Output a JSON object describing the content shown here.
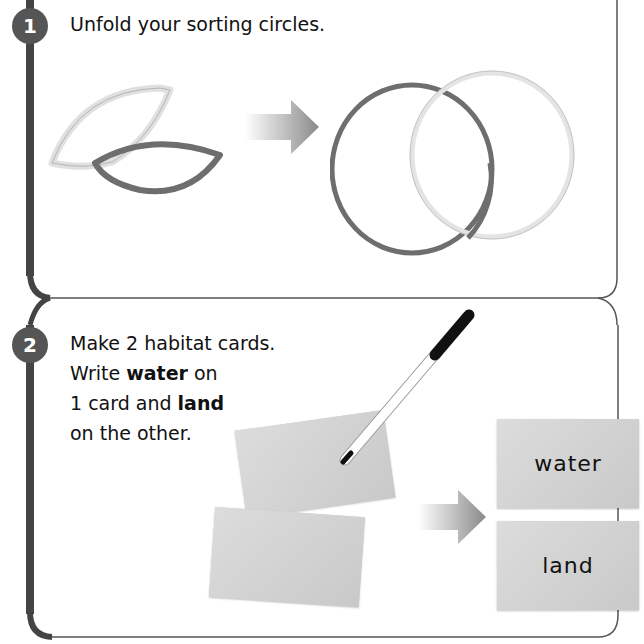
{
  "steps": [
    {
      "number": "1",
      "text": "Unfold your sorting circles."
    },
    {
      "number": "2",
      "lines": [
        {
          "pre": "Make 2 habitat cards.",
          "bold": "",
          "post": ""
        },
        {
          "pre": "Write ",
          "bold": "water",
          "post": " on"
        },
        {
          "pre": "1 card and ",
          "bold": "land",
          "post": ""
        },
        {
          "pre": "on the other.",
          "bold": "",
          "post": ""
        }
      ],
      "cards": [
        {
          "label": "water"
        },
        {
          "label": "land"
        }
      ]
    }
  ],
  "colors": {
    "frame": "#555555",
    "dark_ring": "#6e6e6e",
    "light_ring": "#e4e4e4",
    "card": "#d3d3d3",
    "arrow": "#8a8a8a"
  }
}
